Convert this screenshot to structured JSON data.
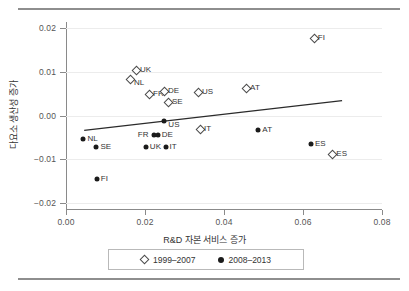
{
  "chart_data": {
    "type": "scatter",
    "title": "",
    "xlabel": "R&D 자본 서비스 증가",
    "ylabel": "다요소 생산성 증가",
    "xlim": [
      0.0,
      0.08
    ],
    "ylim": [
      -0.02,
      0.02
    ],
    "xticks": [
      "0.00",
      "0.02",
      "0.04",
      "0.06",
      "0.08"
    ],
    "xtick_values": [
      0.0,
      0.02,
      0.04,
      0.06,
      0.08
    ],
    "yticks": [
      "0.02",
      "0.01",
      "0.00",
      "-0.01",
      "-0.02"
    ],
    "ytick_values": [
      0.02,
      0.01,
      0.0,
      -0.01,
      -0.02
    ],
    "grid": "horizontal",
    "legend_position": "bottom",
    "series": [
      {
        "name": "1999-2007",
        "marker": "open-diamond",
        "points": [
          {
            "label": "UK",
            "x": 0.0177,
            "y": 0.0104,
            "label_side": "right"
          },
          {
            "label": "NL",
            "x": 0.0162,
            "y": 0.0084,
            "label_side": "right-below"
          },
          {
            "label": "FR",
            "x": 0.021,
            "y": 0.0049,
            "label_side": "right"
          },
          {
            "label": "DE",
            "x": 0.0248,
            "y": 0.0055,
            "label_side": "right"
          },
          {
            "label": "SE",
            "x": 0.0258,
            "y": 0.0032,
            "label_side": "right"
          },
          {
            "label": "US",
            "x": 0.0334,
            "y": 0.0053,
            "label_side": "right"
          },
          {
            "label": "AT",
            "x": 0.0456,
            "y": 0.0064,
            "label_side": "right"
          },
          {
            "label": "FI",
            "x": 0.0627,
            "y": 0.0178,
            "label_side": "right"
          },
          {
            "label": "IT",
            "x": 0.0339,
            "y": -0.003,
            "label_side": "right"
          },
          {
            "label": "ES",
            "x": 0.0674,
            "y": -0.0088,
            "label_side": "right"
          }
        ]
      },
      {
        "name": "2008-2013",
        "marker": "filled-circle",
        "points": [
          {
            "label": "NL",
            "x": 0.0044,
            "y": -0.0053,
            "label_side": "right"
          },
          {
            "label": "SE",
            "x": 0.0077,
            "y": -0.0071,
            "label_side": "right"
          },
          {
            "label": "FI",
            "x": 0.0078,
            "y": -0.0146,
            "label_side": "right"
          },
          {
            "label": "FR",
            "x": 0.0222,
            "y": -0.0044,
            "label_side": "left"
          },
          {
            "label": "DE",
            "x": 0.0232,
            "y": -0.0044,
            "label_side": "right"
          },
          {
            "label": "UK",
            "x": 0.0202,
            "y": -0.0073,
            "label_side": "right"
          },
          {
            "label": "IT",
            "x": 0.0252,
            "y": -0.0073,
            "label_side": "right"
          },
          {
            "label": "US",
            "x": 0.0249,
            "y": -0.0012,
            "label_side": "right-below"
          },
          {
            "label": "AT",
            "x": 0.0487,
            "y": -0.0034,
            "label_side": "right"
          },
          {
            "label": "ES",
            "x": 0.062,
            "y": -0.0066,
            "label_side": "right"
          }
        ]
      }
    ],
    "trendline": {
      "x0": 0.0046,
      "y0": -0.0034,
      "x1": 0.0699,
      "y1": 0.0034
    }
  },
  "legend": {
    "items": [
      {
        "label": "1999–2007",
        "marker": "open-diamond"
      },
      {
        "label": "2008–2013",
        "marker": "filled-circle"
      }
    ]
  }
}
